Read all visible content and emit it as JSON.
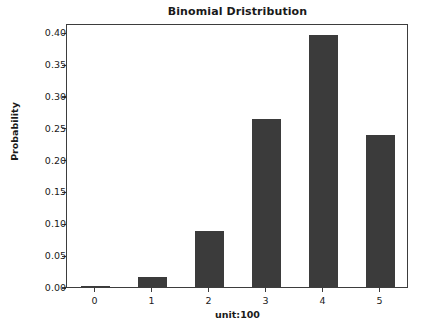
{
  "chart_data": {
    "type": "bar",
    "title": "Binomial Dristribution",
    "xlabel": "unit:100",
    "ylabel": "Probability",
    "categories": [
      "0",
      "1",
      "2",
      "3",
      "4",
      "5"
    ],
    "values": [
      0.0003,
      0.0154,
      0.0881,
      0.2637,
      0.3955,
      0.2393
    ],
    "ylim": [
      0.0,
      0.4146
    ],
    "xlim": [
      -0.5,
      5.5
    ],
    "ytick_labels": [
      "0.00",
      "0.05",
      "0.10",
      "0.15",
      "0.20",
      "0.25",
      "0.30",
      "0.35",
      "0.40"
    ],
    "ytick_values": [
      0.0,
      0.05,
      0.1,
      0.15,
      0.2,
      0.25,
      0.3,
      0.35,
      0.4
    ],
    "xtick_labels": [
      "0",
      "1",
      "2",
      "3",
      "4",
      "5"
    ],
    "grid": false,
    "legend": null,
    "bar_color": "#3b3b3b",
    "bar_width": 0.5,
    "axis_color": "#3d3d3d",
    "background_color": "#ffffff"
  }
}
